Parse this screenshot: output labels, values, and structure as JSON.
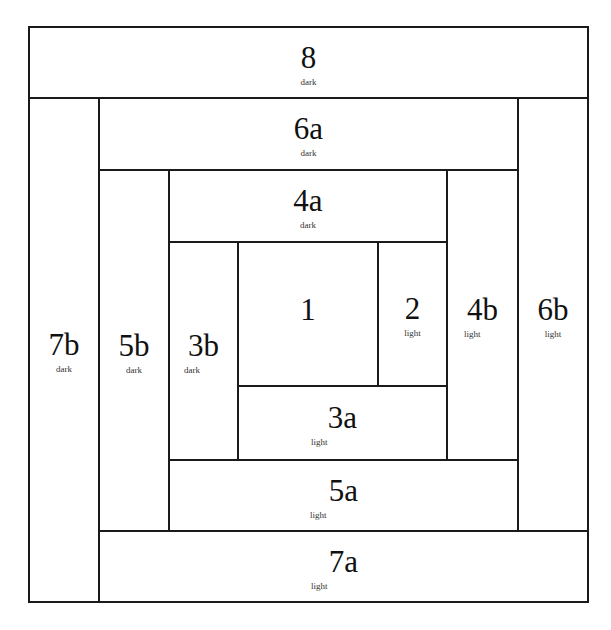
{
  "pieces": {
    "p8": {
      "number": "8",
      "tone": "dark"
    },
    "p6a": {
      "number": "6a",
      "tone": "dark"
    },
    "p4a": {
      "number": "4a",
      "tone": "dark"
    },
    "p7b": {
      "number": "7b",
      "tone": "dark"
    },
    "p5b": {
      "number": "5b",
      "tone": "dark"
    },
    "p3b": {
      "number": "3b",
      "tone": "dark"
    },
    "p1": {
      "number": "1",
      "tone": ""
    },
    "p2": {
      "number": "2",
      "tone": "light"
    },
    "p4b": {
      "number": "4b",
      "tone": "light"
    },
    "p6b": {
      "number": "6b",
      "tone": "light"
    },
    "p3a": {
      "number": "3a",
      "tone": "light"
    },
    "p5a": {
      "number": "5a",
      "tone": "light"
    },
    "p7a": {
      "number": "7a",
      "tone": "light"
    }
  },
  "colors": {
    "line": "#1a1a1a",
    "background": "#ffffff"
  }
}
